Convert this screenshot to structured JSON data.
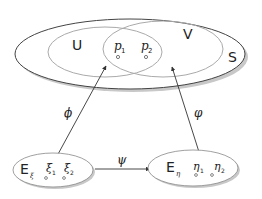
{
  "diagram": {
    "sets": {
      "outer": "S",
      "left": "U",
      "right": "V"
    },
    "points": {
      "p1": {
        "base": "p",
        "sub": "1"
      },
      "p2": {
        "base": "p",
        "sub": "2"
      }
    },
    "spaces": {
      "left": {
        "label": "E",
        "label_sub": "ξ",
        "points": [
          {
            "base": "ξ",
            "sub": "1"
          },
          {
            "base": "ξ",
            "sub": "2"
          }
        ]
      },
      "right": {
        "label": "E",
        "label_sub": "η",
        "points": [
          {
            "base": "η",
            "sub": "1"
          },
          {
            "base": "η",
            "sub": "2"
          }
        ]
      }
    },
    "maps": {
      "phi": "ϕ",
      "varphi": "φ",
      "psi": "ψ"
    }
  }
}
